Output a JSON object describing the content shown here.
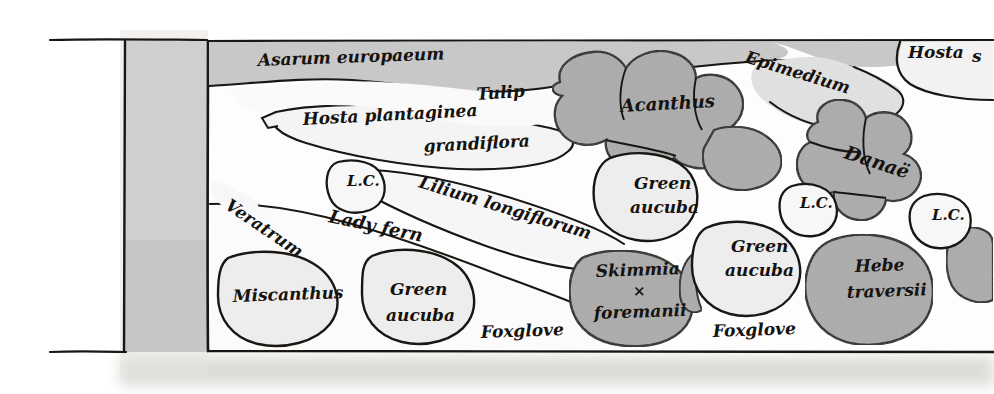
{
  "document": {
    "kind": "hand-drawn-garden-planting-plan",
    "title_visible": false,
    "description": "Pen-and-ink shaded plan of a shady border bed with a path along the left edge; plant groups drawn as outlined blobs and circles, each hand-lettered with its plant name."
  },
  "colors": {
    "paper": "#ffffff",
    "ink": "#1a1713",
    "path_band": "#cfcfcf",
    "bed_tint_light": "#ededed",
    "bed_tint_mid": "#d9d9d9",
    "shape_shaded": "#ababab",
    "shape_shaded_deep": "#9d9d9d",
    "page_shadow": "#d8d6d2"
  },
  "plan": {
    "frame": {
      "top_rule_label": "top boundary line",
      "bottom_rule_label": "bottom boundary line",
      "path_label": "gravel path band"
    },
    "labels": [
      {
        "id": "asarum",
        "text": "Asarum europaeum",
        "x": 258,
        "y": 66,
        "size": 17,
        "rotate": -2,
        "name": "plant-label-asarum-europaeum"
      },
      {
        "id": "epimedium",
        "text": "Epimedium",
        "x": 744,
        "y": 62,
        "size": 17,
        "rotate": 17,
        "name": "plant-label-epimedium"
      },
      {
        "id": "hosta-right",
        "text": "Hosta",
        "x": 908,
        "y": 58,
        "size": 17,
        "rotate": 0,
        "name": "plant-label-hosta"
      },
      {
        "id": "hosta-right-cut",
        "text": "s",
        "x": 972,
        "y": 62,
        "size": 17,
        "rotate": 0,
        "name": "plant-label-hosta-continuation-clipped"
      },
      {
        "id": "tulip",
        "text": "Tulip",
        "x": 477,
        "y": 100,
        "size": 17,
        "rotate": -4,
        "name": "plant-label-tulip"
      },
      {
        "id": "acanthus",
        "text": "Acanthus",
        "x": 621,
        "y": 112,
        "size": 18,
        "rotate": -3,
        "name": "plant-label-acanthus"
      },
      {
        "id": "hosta-plant-1",
        "text": "Hosta plantaginea",
        "x": 303,
        "y": 125,
        "size": 17,
        "rotate": -3,
        "name": "plant-label-hosta-plantaginea"
      },
      {
        "id": "hosta-plant-2",
        "text": "grandiflora",
        "x": 424,
        "y": 152,
        "size": 17,
        "rotate": -3,
        "name": "plant-label-hosta-plantaginea-grandiflora"
      },
      {
        "id": "danae",
        "text": "Danaë",
        "x": 843,
        "y": 158,
        "size": 19,
        "rotate": 18,
        "name": "plant-label-danae"
      },
      {
        "id": "lc-1",
        "text": "L.C.",
        "x": 347,
        "y": 186,
        "size": 15,
        "rotate": 0,
        "name": "plant-label-lc-left"
      },
      {
        "id": "lilium",
        "text": "Lilium longiflorum",
        "x": 418,
        "y": 187,
        "size": 17,
        "rotate": 17,
        "name": "plant-label-lilium-longiflorum"
      },
      {
        "id": "green-aucuba-1",
        "text": "Green",
        "x": 634,
        "y": 189,
        "size": 17,
        "rotate": 0,
        "name": "plant-label-green-aucuba-centre-line1"
      },
      {
        "id": "green-aucuba-1b",
        "text": "aucuba",
        "x": 630,
        "y": 213,
        "size": 17,
        "rotate": 0,
        "name": "plant-label-green-aucuba-centre-line2"
      },
      {
        "id": "lc-2",
        "text": "L.C.",
        "x": 800,
        "y": 208,
        "size": 15,
        "rotate": 0,
        "name": "plant-label-lc-middle"
      },
      {
        "id": "lc-3",
        "text": "L.C.",
        "x": 932,
        "y": 220,
        "size": 15,
        "rotate": 0,
        "name": "plant-label-lc-right"
      },
      {
        "id": "veratrum",
        "text": "Veratrum",
        "x": 224,
        "y": 208,
        "size": 17,
        "rotate": 34,
        "name": "plant-label-veratrum"
      },
      {
        "id": "ladyfern",
        "text": "Lady fern",
        "x": 328,
        "y": 222,
        "size": 18,
        "rotate": 12,
        "name": "plant-label-lady-fern"
      },
      {
        "id": "green-aucuba-2",
        "text": "Green",
        "x": 731,
        "y": 252,
        "size": 17,
        "rotate": 0,
        "name": "plant-label-green-aucuba-right-line1"
      },
      {
        "id": "green-aucuba-2b",
        "text": "aucuba",
        "x": 725,
        "y": 276,
        "size": 17,
        "rotate": 0,
        "name": "plant-label-green-aucuba-right-line2"
      },
      {
        "id": "skimmia-1",
        "text": "Skimmia",
        "x": 596,
        "y": 277,
        "size": 17,
        "rotate": -2,
        "name": "plant-label-skimmia-line1"
      },
      {
        "id": "skimmia-2",
        "text": "×",
        "x": 633,
        "y": 296,
        "size": 15,
        "rotate": 0,
        "name": "plant-label-skimmia-cross"
      },
      {
        "id": "skimmia-3",
        "text": "foremanii",
        "x": 594,
        "y": 319,
        "size": 17,
        "rotate": -2,
        "name": "plant-label-skimmia-foremanii"
      },
      {
        "id": "hebe-1",
        "text": "Hebe",
        "x": 855,
        "y": 272,
        "size": 17,
        "rotate": -2,
        "name": "plant-label-hebe-line1"
      },
      {
        "id": "hebe-2",
        "text": "traversii",
        "x": 847,
        "y": 298,
        "size": 17,
        "rotate": -2,
        "name": "plant-label-hebe-traversii"
      },
      {
        "id": "miscanthus",
        "text": "Miscanthus",
        "x": 233,
        "y": 302,
        "size": 17,
        "rotate": -2,
        "name": "plant-label-miscanthus"
      },
      {
        "id": "green-aucuba-3",
        "text": "Green",
        "x": 390,
        "y": 295,
        "size": 17,
        "rotate": 0,
        "name": "plant-label-green-aucuba-left-line1"
      },
      {
        "id": "green-aucuba-3b",
        "text": "aucuba",
        "x": 386,
        "y": 321,
        "size": 17,
        "rotate": 0,
        "name": "plant-label-green-aucuba-left-line2"
      },
      {
        "id": "foxglove-1",
        "text": "Foxglove",
        "x": 481,
        "y": 338,
        "size": 17,
        "rotate": -2,
        "name": "plant-label-foxglove-left"
      },
      {
        "id": "foxglove-2",
        "text": "Foxglove",
        "x": 713,
        "y": 337,
        "size": 17,
        "rotate": -2,
        "name": "plant-label-foxglove-right"
      }
    ],
    "plant_list": [
      "Asarum europaeum",
      "Epimedium",
      "Hosta",
      "Tulip",
      "Acanthus",
      "Hosta plantaginea grandiflora",
      "Danaë",
      "L.C.",
      "Lilium longiflorum",
      "Green aucuba",
      "Veratrum",
      "Lady fern",
      "Skimmia × foremanii",
      "Hebe traversii",
      "Miscanthus",
      "Foxglove"
    ]
  }
}
